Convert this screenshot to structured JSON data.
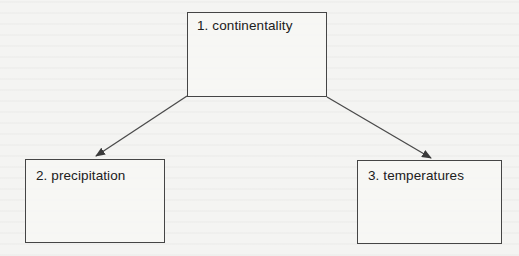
{
  "diagram": {
    "type": "hierarchy",
    "nodes": [
      {
        "id": "1",
        "label": "1. continentality"
      },
      {
        "id": "2",
        "label": "2. precipitation"
      },
      {
        "id": "3",
        "label": "3. temperatures"
      }
    ],
    "edges": [
      {
        "from": "1",
        "to": "2",
        "style": "arrow"
      },
      {
        "from": "1",
        "to": "3",
        "style": "arrow"
      }
    ],
    "colors": {
      "background": "#f4f4f2",
      "stroke": "#454545",
      "text": "#202020"
    }
  }
}
